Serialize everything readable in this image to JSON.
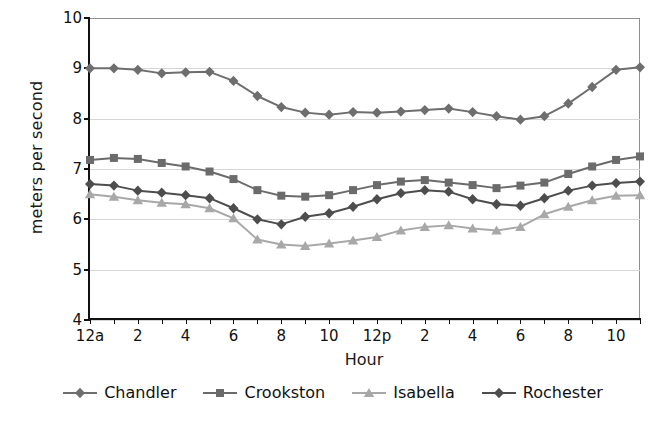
{
  "chart_data": {
    "type": "line",
    "title": "",
    "xlabel": "Hour",
    "ylabel": "meters per second",
    "ylim": [
      4,
      10
    ],
    "ytick_values": [
      4,
      5,
      6,
      7,
      8,
      9,
      10
    ],
    "ytick_labels": [
      "4",
      "5",
      "6",
      "7",
      "8",
      "9",
      "10"
    ],
    "grid": true,
    "grid_axis": "y",
    "legend_position": "bottom",
    "x": [
      0,
      1,
      2,
      3,
      4,
      5,
      6,
      7,
      8,
      9,
      10,
      11,
      12,
      13,
      14,
      15,
      16,
      17,
      18,
      19,
      20,
      21,
      22,
      23
    ],
    "xtick_labels": [
      "12a",
      "",
      "2",
      "",
      "4",
      "",
      "6",
      "",
      "8",
      "",
      "10",
      "",
      "12p",
      "",
      "2",
      "",
      "4",
      "",
      "6",
      "",
      "8",
      "",
      "10",
      ""
    ],
    "xtick_labels_shown": [
      "12a",
      "2",
      "4",
      "6",
      "8",
      "10",
      "12p",
      "2",
      "4",
      "6",
      "8",
      "10"
    ],
    "series": [
      {
        "name": "Chandler",
        "marker": "diamond",
        "color": "#6e6e6e",
        "values": [
          9.0,
          9.0,
          8.97,
          8.9,
          8.92,
          8.93,
          8.75,
          8.45,
          8.23,
          8.12,
          8.08,
          8.13,
          8.12,
          8.14,
          8.17,
          8.2,
          8.13,
          8.05,
          7.98,
          8.05,
          8.3,
          8.63,
          8.97,
          9.02
        ]
      },
      {
        "name": "Crookston",
        "marker": "square",
        "color": "#6b6b6b",
        "values": [
          7.18,
          7.22,
          7.2,
          7.12,
          7.05,
          6.95,
          6.8,
          6.58,
          6.47,
          6.45,
          6.48,
          6.58,
          6.68,
          6.75,
          6.78,
          6.73,
          6.68,
          6.62,
          6.67,
          6.73,
          6.9,
          7.05,
          7.18,
          7.25
        ]
      },
      {
        "name": "Isabella",
        "marker": "triangle",
        "color": "#a8a8a8",
        "values": [
          6.5,
          6.45,
          6.38,
          6.33,
          6.3,
          6.22,
          6.02,
          5.6,
          5.5,
          5.47,
          5.52,
          5.58,
          5.65,
          5.78,
          5.85,
          5.88,
          5.82,
          5.78,
          5.85,
          6.1,
          6.25,
          6.38,
          6.47,
          6.48
        ]
      },
      {
        "name": "Rochester",
        "marker": "diamond",
        "color": "#4d4d4d",
        "values": [
          6.7,
          6.67,
          6.57,
          6.53,
          6.48,
          6.42,
          6.22,
          6.0,
          5.9,
          6.05,
          6.12,
          6.25,
          6.4,
          6.52,
          6.58,
          6.55,
          6.4,
          6.3,
          6.27,
          6.42,
          6.57,
          6.67,
          6.72,
          6.75
        ]
      }
    ]
  },
  "legend": {
    "items": [
      {
        "label": "Chandler",
        "marker": "diamond",
        "color": "#6e6e6e"
      },
      {
        "label": "Crookston",
        "marker": "square",
        "color": "#6b6b6b"
      },
      {
        "label": "Isabella",
        "marker": "triangle",
        "color": "#a8a8a8"
      },
      {
        "label": "Rochester",
        "marker": "diamond",
        "color": "#4d4d4d"
      }
    ]
  }
}
